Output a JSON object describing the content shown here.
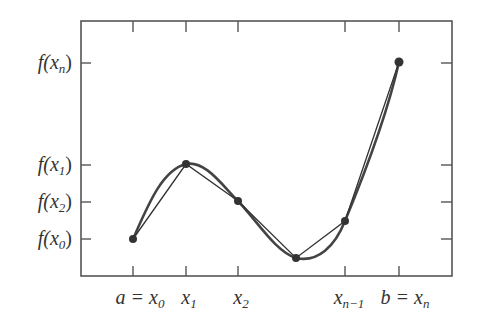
{
  "diagram": {
    "type": "piecewise-linear-approximation",
    "frame": {
      "left": 81,
      "top": 21,
      "right": 452,
      "bottom": 276
    },
    "colors": {
      "frame": "#555555",
      "curve": "#444444",
      "chord": "#333333",
      "point": "#333333",
      "text": "#333333"
    },
    "x_ticks": [
      {
        "id": "x0",
        "px": 133,
        "label": "a = x",
        "sub": "0"
      },
      {
        "id": "x1",
        "px": 186,
        "label": "x",
        "sub": "1"
      },
      {
        "id": "x2",
        "px": 238,
        "label": "x",
        "sub": "2"
      },
      {
        "id": "xn1",
        "px": 345,
        "label": "x",
        "sub": "n−1"
      },
      {
        "id": "xn",
        "px": 399,
        "label": "b = x",
        "sub": "n"
      }
    ],
    "y_ticks": [
      {
        "id": "fxn",
        "py": 63,
        "label": "f(x",
        "sub": "n",
        "close": ")"
      },
      {
        "id": "fx1",
        "py": 165,
        "label": "f(x",
        "sub": "1",
        "close": ")"
      },
      {
        "id": "fx2",
        "py": 202,
        "label": "f(x",
        "sub": "2",
        "close": ")"
      },
      {
        "id": "fx0",
        "py": 239,
        "label": "f(x",
        "sub": "0",
        "close": ")"
      }
    ],
    "points": [
      {
        "x": 133,
        "y": 239
      },
      {
        "x": 186,
        "y": 164
      },
      {
        "x": 238,
        "y": 201
      },
      {
        "x": 296,
        "y": 258
      },
      {
        "x": 345,
        "y": 221
      },
      {
        "x": 399,
        "y": 62
      }
    ]
  }
}
